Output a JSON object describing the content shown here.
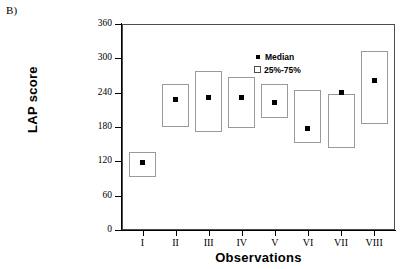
{
  "panel": {
    "label": "B)"
  },
  "legend": {
    "median_label": "Median",
    "range_label": "25%-75%",
    "position": "top-left-inside",
    "median_marker_color": "#000000",
    "box_edge_color": "#9a9a9a"
  },
  "axes": {
    "y_title": "LAP score",
    "x_title": "Observations",
    "y_ticks": [
      0,
      60,
      120,
      180,
      240,
      300,
      360
    ],
    "x_ticks": [
      "I",
      "II",
      "III",
      "IV",
      "V",
      "VI",
      "VII",
      "VIII"
    ]
  },
  "chart_data": {
    "type": "box",
    "title": "",
    "subtitle": "",
    "xlabel": "Observations",
    "ylabel": "LAP score",
    "categories": [
      "I",
      "II",
      "III",
      "IV",
      "V",
      "VI",
      "VII",
      "VIII"
    ],
    "ylim": [
      0,
      360
    ],
    "xlim_categories": 8,
    "grid": false,
    "legend": [
      "Median",
      "25%-75%"
    ],
    "series": [
      {
        "name": "Median",
        "values": [
          118,
          228,
          232,
          232,
          222,
          178,
          240,
          262
        ]
      },
      {
        "name": "25%",
        "values": [
          92,
          180,
          172,
          178,
          196,
          152,
          144,
          186
        ]
      },
      {
        "name": "75%",
        "values": [
          136,
          256,
          278,
          268,
          256,
          244,
          238,
          312
        ]
      }
    ],
    "boxes": [
      {
        "category": "I",
        "q1": 92,
        "q3": 136,
        "median": 118
      },
      {
        "category": "II",
        "q1": 180,
        "q3": 256,
        "median": 228
      },
      {
        "category": "III",
        "q1": 172,
        "q3": 278,
        "median": 232
      },
      {
        "category": "IV",
        "q1": 178,
        "q3": 268,
        "median": 232
      },
      {
        "category": "V",
        "q1": 196,
        "q3": 256,
        "median": 222
      },
      {
        "category": "VI",
        "q1": 152,
        "q3": 244,
        "median": 178
      },
      {
        "category": "VII",
        "q1": 144,
        "q3": 238,
        "median": 240
      },
      {
        "category": "VIII",
        "q1": 186,
        "q3": 312,
        "median": 262
      }
    ]
  }
}
